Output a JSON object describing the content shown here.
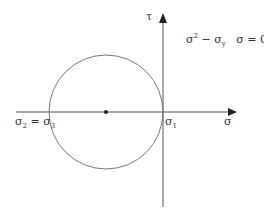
{
  "diagram": {
    "type": "mohr-circle",
    "axes": {
      "horizontal_label": "σ",
      "vertical_label": "τ",
      "line_color": "#555555"
    },
    "equation": {
      "left_base": "σ",
      "left_sup": "2",
      "minus": " − σ",
      "minus_sub": "y",
      "condition": "σ = 0"
    },
    "labels": {
      "sigma2_base": "σ",
      "sigma2_sub": "2",
      "equals": " = σ",
      "sigma3_sub": "3",
      "sigma1_base": "σ",
      "sigma1_sub": "1"
    },
    "circle": {
      "center_x": 106,
      "center_y": 112,
      "radius": 57,
      "stroke": "#777777"
    }
  }
}
